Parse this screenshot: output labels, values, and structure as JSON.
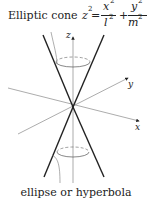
{
  "title": {
    "prefix": "Elliptic cone ",
    "lhs_var": "z",
    "lhs_exp": "2",
    "equals": " = ",
    "term1_num": "x",
    "term1_num_exp": "2",
    "term1_den": "l",
    "term1_den_exp": "2",
    "plus": "+",
    "term2_num": "y",
    "term2_num_exp": "2",
    "term2_den": "m",
    "term2_den_exp": "2"
  },
  "axes": {
    "z_label": "z",
    "y_label": "y",
    "x_label": "x"
  },
  "caption": "ellipse or hyperbola",
  "colors": {
    "cone_lines": "#222222",
    "axes": "#888888",
    "ellipse": "#555555",
    "background": "#ffffff"
  }
}
